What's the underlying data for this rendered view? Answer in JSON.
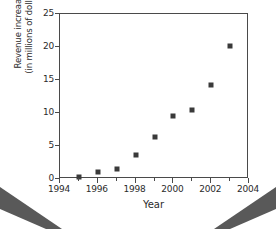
{
  "chart_data": {
    "type": "scatter",
    "title": "",
    "subtitle": "",
    "xlabel": "Year",
    "ylabel_line1": "Revenue increaase",
    "ylabel_line2": "(in millions of dollars)",
    "ylabel": "Revenue increaase (in millions of dollars)",
    "x": [
      1995,
      1996,
      1997,
      1998,
      1999,
      2000,
      2001,
      2002,
      2003
    ],
    "values": [
      0.3,
      1.1,
      1.5,
      3.6,
      6.4,
      9.5,
      10.5,
      14.3,
      20.1
    ],
    "points": [
      {
        "x": 1995,
        "y": 0.3
      },
      {
        "x": 1996,
        "y": 1.1
      },
      {
        "x": 1997,
        "y": 1.5
      },
      {
        "x": 1998,
        "y": 3.6
      },
      {
        "x": 1999,
        "y": 6.4
      },
      {
        "x": 2000,
        "y": 9.5
      },
      {
        "x": 2001,
        "y": 10.5
      },
      {
        "x": 2002,
        "y": 14.3
      },
      {
        "x": 2003,
        "y": 20.1
      }
    ],
    "xlim": [
      1994,
      2004
    ],
    "ylim": [
      0,
      25
    ],
    "xticks": [
      1994,
      1996,
      1998,
      2000,
      2002,
      2004
    ],
    "xticklabels": [
      "1994",
      "1996",
      "1998",
      "2000",
      "2002",
      "2004"
    ],
    "xminorticks": [
      1995,
      1997,
      1999,
      2001,
      2003
    ],
    "yticks": [
      0,
      5,
      10,
      15,
      20,
      25
    ],
    "yticklabels": [
      "0",
      "5",
      "10",
      "15",
      "20",
      "25"
    ],
    "grid": false,
    "legend": null,
    "legend_position": "none",
    "marker": "square",
    "marker_color": "#3a3a3a",
    "axis_color": "#4a4a4a",
    "background_color": "#ffffff",
    "annotations": []
  },
  "decorations": {
    "corner_wedge_left_name": "page-corner-wedge-left",
    "corner_wedge_right_name": "page-corner-wedge-right",
    "wedge_color": "#595959"
  }
}
